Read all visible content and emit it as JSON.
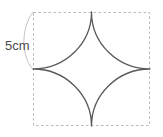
{
  "figure": {
    "canvas": {
      "width": 163,
      "height": 137,
      "background": "#ffffff"
    },
    "square": {
      "name": "dashed-bounding-square",
      "x": 33,
      "y": 12,
      "width": 117,
      "height": 114,
      "stroke": "#b9b9b9",
      "stroke_width": 1,
      "dash": "2.5 2.5",
      "fill": "none"
    },
    "star": {
      "name": "concave-four-pointed-star",
      "description": "four quarter-circle arcs centred on the square corners, radius = half the side",
      "arc_radius_x": 58.5,
      "arc_radius_y": 57,
      "points": [
        {
          "label": "top",
          "x": 91.5,
          "y": 12
        },
        {
          "label": "right",
          "x": 150,
          "y": 69
        },
        {
          "label": "bottom",
          "x": 91.5,
          "y": 126
        },
        {
          "label": "left",
          "x": 33,
          "y": 69
        }
      ],
      "stroke": "#595959",
      "stroke_width": 1.3,
      "fill": "#ffffff"
    },
    "dimension": {
      "name": "side-length-dimension",
      "label": "5cm",
      "value": 5,
      "unit": "cm",
      "label_x": 5,
      "label_y": 50,
      "leader_stroke": "#bdbdbd",
      "leader_stroke_width": 0.9,
      "leader_path": "M 33 12 C 22 26, 20 54, 32.5 69"
    }
  }
}
